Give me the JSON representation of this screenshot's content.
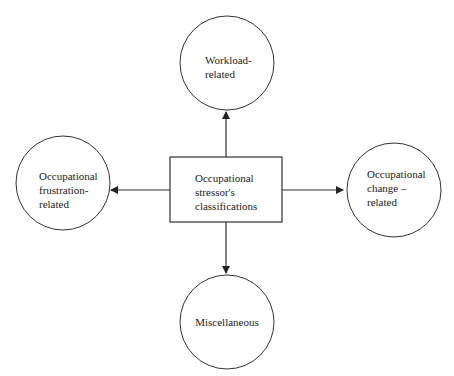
{
  "diagram": {
    "center": {
      "lines": [
        "Occupational",
        "stressor's",
        "classifications"
      ]
    },
    "nodes": {
      "top": {
        "lines": [
          "Workload-",
          "related"
        ]
      },
      "left": {
        "lines": [
          "Occupational",
          "frustration-",
          "related"
        ]
      },
      "right": {
        "lines": [
          "Occupational",
          "change –",
          "related"
        ]
      },
      "bottom": {
        "lines": [
          "Miscellaneous"
        ]
      }
    },
    "colors": {
      "stroke": "#333333",
      "text": "#222222",
      "background": "#ffffff"
    }
  }
}
